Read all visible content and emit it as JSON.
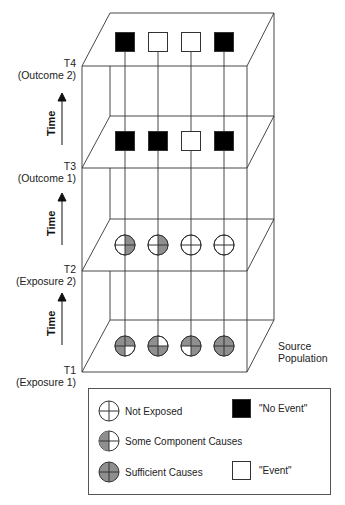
{
  "diagram": {
    "colors": {
      "line": "#333333",
      "shaded": "#8f8f8f",
      "no_event": "#000000",
      "event": "#ffffff"
    },
    "levels": [
      {
        "id": "T4",
        "label": "T4",
        "sublabel": "(Outcome 2)",
        "kind": "outcome",
        "items": [
          "no_event",
          "event",
          "event",
          "no_event"
        ]
      },
      {
        "id": "T3",
        "label": "T3",
        "sublabel": "(Outcome 1)",
        "kind": "outcome",
        "items": [
          "no_event",
          "no_event",
          "event",
          "no_event"
        ]
      },
      {
        "id": "T2",
        "label": "T2",
        "sublabel": "(Exposure 2)",
        "kind": "exposure",
        "items": [
          [
            "tr",
            "br"
          ],
          [
            "tr",
            "br"
          ],
          [],
          []
        ]
      },
      {
        "id": "T1",
        "label": "T1",
        "sublabel": "(Exposure 1)",
        "kind": "exposure",
        "items": [
          [
            "tl",
            "tr",
            "bl"
          ],
          [
            "tl",
            "bl",
            "br"
          ],
          [
            "tl",
            "tr",
            "br"
          ],
          [
            "tl",
            "tr",
            "bl",
            "br"
          ]
        ]
      }
    ],
    "time_label": "Time",
    "source_label_line1": "Source",
    "source_label_line2": "Population"
  },
  "legend": {
    "not_exposed": "Not Exposed",
    "some_component": "Some Component Causes",
    "sufficient": "Sufficient Causes",
    "no_event": "\"No Event\"",
    "event": "\"Event\""
  }
}
